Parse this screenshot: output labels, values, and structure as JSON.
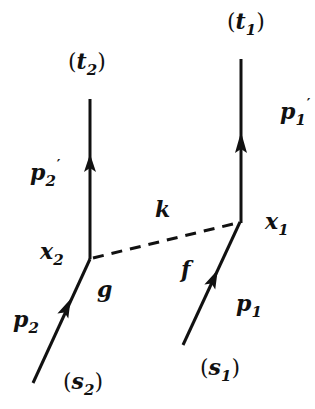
{
  "diagram": {
    "title": "",
    "colors": {
      "line": "#111111",
      "background": "#ffffff"
    },
    "lines": [
      {
        "id": "p2prime-line",
        "type": "solid",
        "from": [
          90,
          99
        ],
        "to": [
          90,
          259
        ],
        "arrow_at": [
          90,
          162
        ]
      },
      {
        "id": "p1prime-line",
        "type": "solid",
        "from": [
          241,
          59
        ],
        "to": [
          241,
          222
        ],
        "arrow_at": [
          241,
          140
        ]
      },
      {
        "id": "p2-line",
        "type": "solid",
        "from": [
          33,
          383
        ],
        "to": [
          90,
          259
        ],
        "arrow_at": [
          66,
          311
        ]
      },
      {
        "id": "p1-line",
        "type": "solid",
        "from": [
          183,
          345
        ],
        "to": [
          240,
          222
        ],
        "arrow_at": [
          213,
          280
        ]
      },
      {
        "id": "k-exchange-line",
        "type": "dashed",
        "from": [
          92,
          258
        ],
        "to": [
          237,
          223
        ]
      }
    ],
    "labels": {
      "t2": {
        "base": "t",
        "sub": "2",
        "paren": true
      },
      "t1": {
        "base": "t",
        "sub": "1",
        "paren": true
      },
      "p1prime": {
        "base": "p",
        "sub": "1",
        "sup": "′"
      },
      "p2prime": {
        "base": "p",
        "sub": "2",
        "sup": "′"
      },
      "k": {
        "base": "k"
      },
      "x1": {
        "base": "x",
        "sub": "1"
      },
      "x2": {
        "base": "x",
        "sub": "2"
      },
      "f": {
        "base": "f"
      },
      "g": {
        "base": "g"
      },
      "p1": {
        "base": "p",
        "sub": "1"
      },
      "p2": {
        "base": "p",
        "sub": "2"
      },
      "s1": {
        "base": "s",
        "sub": "1",
        "paren": true
      },
      "s2": {
        "base": "s",
        "sub": "2",
        "paren": true
      }
    },
    "text": {
      "open": "(",
      "close": ")"
    }
  }
}
